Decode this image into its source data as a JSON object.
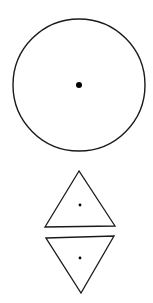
{
  "diagram": {
    "background": "#ffffff",
    "stroke": "#1a1a1a",
    "shapes": [
      {
        "type": "circle",
        "cx": 79,
        "cy": 85,
        "r": 66,
        "center_dot": {
          "cx": 79,
          "cy": 85,
          "r": 3
        }
      },
      {
        "type": "triangle-up",
        "points": "79,171 45,227 115,226",
        "center_dot": {
          "cx": 80,
          "cy": 205,
          "r": 1.4
        }
      },
      {
        "type": "triangle-down",
        "points": "46,238 114,236 81,293",
        "center_dot": {
          "cx": 80,
          "cy": 258,
          "r": 1.4
        }
      }
    ]
  }
}
